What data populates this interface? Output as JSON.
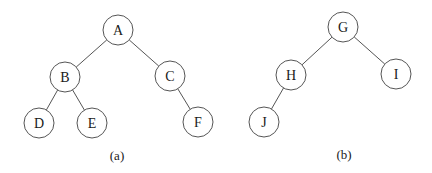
{
  "figure": {
    "trees": [
      {
        "caption": "(a)",
        "nodes": [
          {
            "id": "A",
            "label": "A"
          },
          {
            "id": "B",
            "label": "B"
          },
          {
            "id": "C",
            "label": "C"
          },
          {
            "id": "D",
            "label": "D"
          },
          {
            "id": "E",
            "label": "E"
          },
          {
            "id": "F",
            "label": "F"
          }
        ],
        "edges": [
          [
            "A",
            "B"
          ],
          [
            "A",
            "C"
          ],
          [
            "B",
            "D"
          ],
          [
            "B",
            "E"
          ],
          [
            "C",
            "F"
          ]
        ]
      },
      {
        "caption": "(b)",
        "nodes": [
          {
            "id": "G",
            "label": "G"
          },
          {
            "id": "H",
            "label": "H"
          },
          {
            "id": "I",
            "label": "I"
          },
          {
            "id": "J",
            "label": "J"
          }
        ],
        "edges": [
          [
            "G",
            "H"
          ],
          [
            "G",
            "I"
          ],
          [
            "H",
            "J"
          ]
        ]
      }
    ]
  }
}
